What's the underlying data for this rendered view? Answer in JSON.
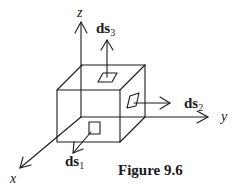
{
  "figure": {
    "caption": "Figure 9.6"
  },
  "axes": {
    "x": {
      "label": "x"
    },
    "y": {
      "label": "y"
    },
    "z": {
      "label": "z"
    }
  },
  "vectors": [
    {
      "id": "ds1",
      "base": "ds",
      "sub": "1",
      "face": "front (x-normal)"
    },
    {
      "id": "ds2",
      "base": "ds",
      "sub": "2",
      "face": "right (y-normal)"
    },
    {
      "id": "ds3",
      "base": "ds",
      "sub": "3",
      "face": "top (z-normal)"
    }
  ],
  "colors": {
    "line": "#1a1a1a",
    "background": "#ffffff"
  }
}
